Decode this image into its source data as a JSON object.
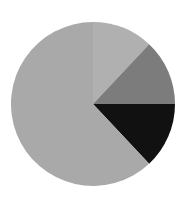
{
  "chart_data": {
    "type": "pie",
    "title": "",
    "categories": [
      "Slice A",
      "Slice B",
      "Slice C",
      "Slice D"
    ],
    "values": [
      12,
      13,
      13,
      62
    ],
    "colors": [
      "#b0b0b0",
      "#7c7c7c",
      "#111111",
      "#a9a9a9"
    ],
    "start_angle_deg": 0,
    "direction": "clockwise",
    "legend": false,
    "center": [
      93,
      104
    ],
    "radius": 82
  }
}
